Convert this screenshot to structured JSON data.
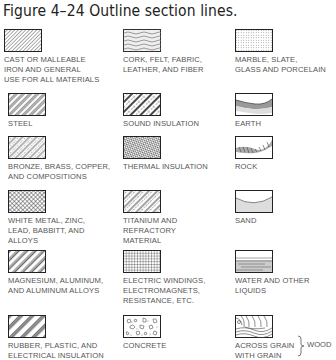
{
  "figure": {
    "title": "Figure 4–24 Outline section lines."
  },
  "materials": [
    {
      "id": "cast-iron",
      "label": "CAST OR MALLEABLE\nIRON AND GENERAL\nUSE FOR ALL MATERIALS",
      "pattern": "fine-diagonal-hatch"
    },
    {
      "id": "cork",
      "label": "CORK, FELT, FABRIC,\nLEATHER, AND FIBER",
      "pattern": "wavy-hatch"
    },
    {
      "id": "marble",
      "label": "MARBLE, SLATE,\nGLASS AND PORCELAIN",
      "pattern": "stipple-grid"
    },
    {
      "id": "steel",
      "label": "STEEL",
      "pattern": "double-diagonal-hatch"
    },
    {
      "id": "sound-insulation",
      "label": "SOUND INSULATION",
      "pattern": "diagonal-bands-with-texture"
    },
    {
      "id": "earth",
      "label": "EARTH",
      "pattern": "curved-earth-band"
    },
    {
      "id": "bronze",
      "label": "BRONZE, BRASS, COPPER,\nAND COMPOSITIONS",
      "pattern": "diagonal-dashed-hatch"
    },
    {
      "id": "thermal-insulation",
      "label": "THERMAL INSULATION",
      "pattern": "zigzag-hatch"
    },
    {
      "id": "rock",
      "label": "ROCK",
      "pattern": "rock-band"
    },
    {
      "id": "white-metal",
      "label": "WHITE METAL, ZINC,\nLEAD, BABBITT, AND\nALLOYS",
      "pattern": "cross-hatch"
    },
    {
      "id": "titanium",
      "label": "TITANIUM AND\nREFRACTORY\nMATERIAL",
      "pattern": "alternating-diagonal"
    },
    {
      "id": "sand",
      "label": "SAND",
      "pattern": "sand-curve"
    },
    {
      "id": "magnesium",
      "label": "MAGNESIUM, ALUMINUM,\nAND ALUMINUM ALLOYS",
      "pattern": "wide-diagonal-pairs"
    },
    {
      "id": "electric-windings",
      "label": "ELECTRIC WINDINGS,\nELECTROMAGNETS,\nRESISTANCE, ETC.",
      "pattern": "square-grid"
    },
    {
      "id": "water",
      "label": "WATER AND OTHER\nLIQUIDS",
      "pattern": "horizontal-lines"
    },
    {
      "id": "rubber",
      "label": "RUBBER, PLASTIC, AND\nELECTRICAL INSULATION",
      "pattern": "thick-diagonal-bands"
    },
    {
      "id": "concrete",
      "label": "CONCRETE",
      "pattern": "aggregate"
    },
    {
      "id": "wood",
      "label": "ACROSS GRAIN\nWITH GRAIN",
      "pattern": "wood-grain"
    }
  ],
  "wood_group_label": "WOOD"
}
